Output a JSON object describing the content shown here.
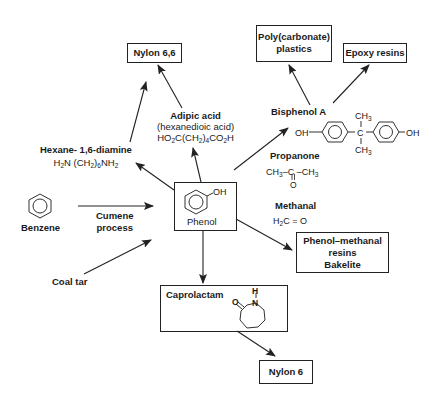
{
  "diagram": {
    "center": {
      "label": "Phenol",
      "substituent": "OH"
    },
    "sources": {
      "benzene": {
        "label": "Benzene",
        "process": [
          "Cumene",
          "process"
        ]
      },
      "coal_tar": {
        "label": "Coal tar"
      }
    },
    "intermediates": {
      "hexane_diamine": {
        "name": "Hexane- 1,6-diamine",
        "formula_parts": [
          "H",
          "2",
          "N (CH",
          "2",
          ")",
          "6",
          "NH",
          "2"
        ]
      },
      "adipic_acid": {
        "name": "Adipic acid",
        "alt_name": "(hexanedioic acid)",
        "formula_parts": [
          "HO",
          "2",
          "C(CH",
          "2",
          ")",
          "4",
          "CO",
          "2",
          "H"
        ]
      },
      "bisphenol_a": {
        "name": "Bisphenol A",
        "left_group": "OH",
        "right_group": "OH",
        "top_group": "CH3",
        "bottom_group": "CH3",
        "center_atom": "C"
      },
      "propanone": {
        "name": "Propanone",
        "formula": "CH3–C–CH3",
        "carbonyl_o": "O"
      },
      "methanal": {
        "name": "Methanal",
        "formula": "H2C=O"
      }
    },
    "products": {
      "nylon_66": {
        "label": "Nylon 6,6"
      },
      "polycarbonate": {
        "line1": "Poly(carbonate)",
        "line2": "plastics"
      },
      "epoxy": {
        "label": "Epoxy resins"
      },
      "phenol_methanal": {
        "line1": "Phenol–methanal",
        "line2": "resins",
        "line3": "Bakelite"
      },
      "caprolactam": {
        "label": "Caprolactam",
        "atoms": {
          "o": "O",
          "n": "N",
          "h": "H"
        }
      },
      "nylon_6": {
        "label": "Nylon 6"
      }
    },
    "colors": {
      "line": "#222222",
      "background": "#ffffff",
      "text": "#1a1a1a"
    }
  }
}
